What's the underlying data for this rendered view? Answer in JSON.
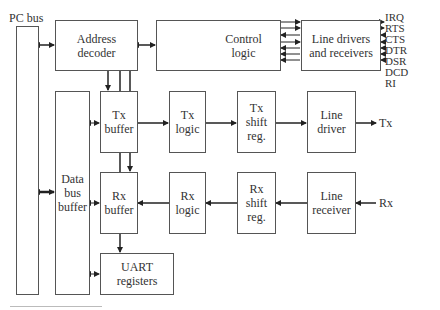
{
  "diagram": {
    "title_label": "PC bus",
    "blocks": {
      "address_decoder": "Address\ndecoder",
      "control_logic": "Control\nlogic",
      "line_drivers_receivers": "Line drivers\nand receivers",
      "data_bus_buffer": "Data\nbus\nbuffer",
      "tx_buffer": "Tx\nbuffer",
      "tx_logic": "Tx\nlogic",
      "tx_shift_reg": "Tx\nshift\nreg.",
      "line_driver": "Line\ndriver",
      "rx_buffer": "Rx\nbuffer",
      "rx_logic": "Rx\nlogic",
      "rx_shift_reg": "Rx\nshift\nreg.",
      "line_receiver": "Line\nreceiver",
      "uart_registers": "UART\nregisters"
    },
    "signals": [
      "IRQ",
      "RTS",
      "CTS",
      "DTR",
      "DSR",
      "DCD",
      "RI"
    ],
    "tx_label": "Tx",
    "rx_label": "Rx",
    "colors": {
      "line": "#333333",
      "box_border": "#555555"
    }
  }
}
